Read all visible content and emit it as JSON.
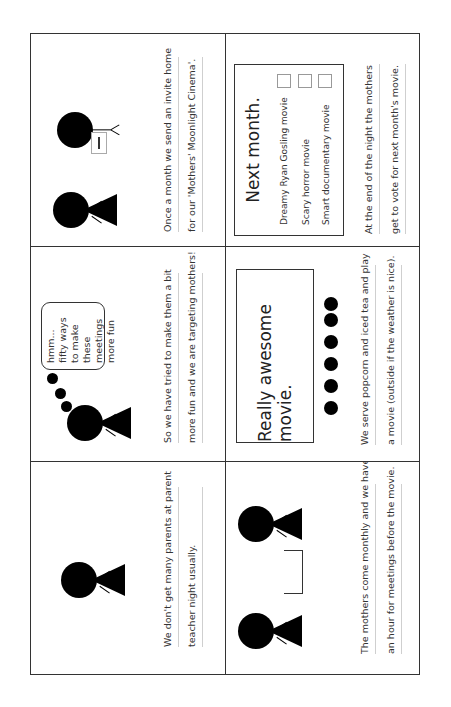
{
  "storyboard": {
    "orientation": "rotated-90-ccw",
    "panels": [
      {
        "id": 1,
        "caption_lines": [
          "We don't get many parents at parent",
          "teacher night usually."
        ],
        "scene": "single-mother-figure"
      },
      {
        "id": 2,
        "caption_lines": [
          "So we have tried to make them a bit",
          "more fun and we are targeting mothers!"
        ],
        "scene": "mother-thinking",
        "thought_bubble": "hmm... fifty ways to make these meetings more fun"
      },
      {
        "id": 3,
        "caption_lines": [
          "Once a month we send an invite home",
          "for our 'Mothers' Moonlight Cinema'."
        ],
        "scene": "mother-and-child-with-invite"
      },
      {
        "id": 4,
        "caption_lines": [
          "The mothers come monthly and we have",
          "an hour for meetings before the movie."
        ],
        "scene": "two-mothers-at-table"
      },
      {
        "id": 5,
        "caption_lines": [
          "We serve popcorn and iced tea and play",
          "a movie (outside if the weather is nice)."
        ],
        "scene": "movie-screen-with-audience",
        "screen_text": "Really awesome movie.",
        "audience_count": 6
      },
      {
        "id": 6,
        "caption_lines": [
          "At the end of  the night the mothers",
          "get to vote for next month's movie."
        ],
        "scene": "vote-card",
        "card_title": "Next month.",
        "options": [
          "Dreamy Ryan Gosling movie",
          "Scary horror movie",
          "Smart documentary movie"
        ]
      }
    ],
    "colors": {
      "ink": "#000000",
      "border": "#333333",
      "caption_text": "#333333",
      "rule_line": "#cfcfcf",
      "checkbox_border": "#999999",
      "background": "#ffffff"
    }
  }
}
